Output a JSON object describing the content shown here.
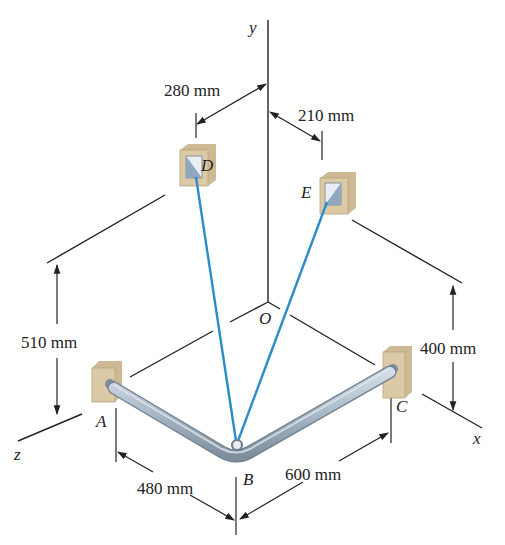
{
  "diagram": {
    "axes": {
      "x": "x",
      "y": "y",
      "z": "z",
      "origin": "O"
    },
    "points": {
      "A": "A",
      "B": "B",
      "C": "C",
      "D": "D",
      "E": "E"
    },
    "dimensions": {
      "d280": "280 mm",
      "d210": "210 mm",
      "d510": "510 mm",
      "d400": "400 mm",
      "d480": "480 mm",
      "d600": "600 mm"
    },
    "colors": {
      "cable": "#2a8cc8",
      "pipe": "#a9b8c6",
      "pipe_dark": "#7f8e9c",
      "support": "#d9c6a2",
      "line": "#222222"
    }
  }
}
